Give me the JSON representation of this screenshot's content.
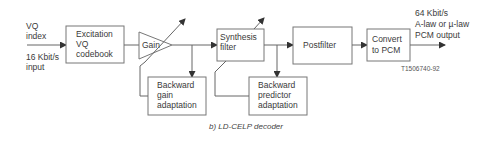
{
  "diagram": {
    "inputs": {
      "vq_index": [
        "VQ",
        "index"
      ],
      "rate": [
        "16 Kbit/s",
        "input"
      ]
    },
    "blocks": {
      "excitation": [
        "Excitation",
        "VQ",
        "codebook"
      ],
      "gain": "Gain",
      "synthesis": [
        "Synthesis",
        "filter"
      ],
      "postfilter": "Postfilter",
      "convert": [
        "Convert",
        "to PCM"
      ],
      "backward_gain": [
        "Backward",
        "gain",
        "adaptation"
      ],
      "backward_predictor": [
        "Backward",
        "predictor",
        "adaptation"
      ]
    },
    "output": [
      "64 Kbit/s",
      "A-law or µ-law",
      "PCM output"
    ],
    "figure_id": "T1506740-92",
    "caption": "b)  LD-CELP decoder"
  }
}
